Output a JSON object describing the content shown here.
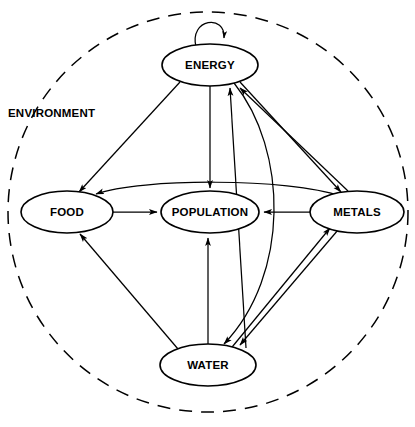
{
  "diagram": {
    "boundary": {
      "name": "environment-boundary",
      "label": "ENVIRONMENT",
      "shape": "dashed-circle",
      "label_x": 8,
      "label_y": 117,
      "cx": 208,
      "cy": 212,
      "r": 200,
      "color": "#000000"
    },
    "nodes": [
      {
        "id": "energy",
        "label": "ENERGY",
        "cx": 210,
        "cy": 65,
        "rx": 48,
        "ry": 21
      },
      {
        "id": "food",
        "label": "FOOD",
        "cx": 67,
        "cy": 212,
        "rx": 46,
        "ry": 21
      },
      {
        "id": "population",
        "label": "POPULATION",
        "cx": 210,
        "cy": 212,
        "rx": 49,
        "ry": 21
      },
      {
        "id": "metals",
        "label": "METALS",
        "cx": 357,
        "cy": 212,
        "rx": 47,
        "ry": 21
      },
      {
        "id": "water",
        "label": "WATER",
        "cx": 208,
        "cy": 365,
        "rx": 48,
        "ry": 21
      }
    ],
    "edges": [
      {
        "id": "energy-self",
        "from": "energy",
        "to": "energy",
        "style": "self-loop"
      },
      {
        "id": "energy-food",
        "from": "energy",
        "to": "food",
        "style": "straight"
      },
      {
        "id": "energy-population",
        "from": "energy",
        "to": "population",
        "style": "straight"
      },
      {
        "id": "energy-metals",
        "from": "energy",
        "to": "metals",
        "style": "straight"
      },
      {
        "id": "energy-water",
        "from": "energy",
        "to": "water",
        "style": "curved"
      },
      {
        "id": "food-population",
        "from": "food",
        "to": "population",
        "style": "straight"
      },
      {
        "id": "metals-population",
        "from": "metals",
        "to": "population",
        "style": "straight"
      },
      {
        "id": "metals-food",
        "from": "metals",
        "to": "food",
        "style": "curved-arc"
      },
      {
        "id": "metals-energy",
        "from": "metals",
        "to": "energy",
        "style": "straight"
      },
      {
        "id": "metals-water",
        "from": "metals",
        "to": "water",
        "style": "straight"
      },
      {
        "id": "water-food",
        "from": "water",
        "to": "food",
        "style": "straight"
      },
      {
        "id": "water-population",
        "from": "water",
        "to": "population",
        "style": "straight"
      },
      {
        "id": "water-metals",
        "from": "water",
        "to": "metals",
        "style": "straight"
      },
      {
        "id": "water-energy",
        "from": "water",
        "to": "energy",
        "style": "straight"
      }
    ]
  }
}
